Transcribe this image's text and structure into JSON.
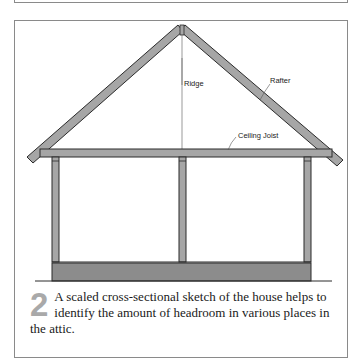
{
  "figure": {
    "step_number": "2",
    "caption": "A scaled cross-sectional sketch of the house helps to identify the amount of headroom in various places in the attic.",
    "labels": {
      "ridge": "Ridge",
      "rafter": "Rafter",
      "ceiling_joist": "Ceiling Joist"
    },
    "colors": {
      "member_fill": "#a6a6a6",
      "member_stroke": "#2b2b2b",
      "foundation_fill": "#8c8c8c",
      "frame_border": "#8a8a8a",
      "number_color": "#a9a9a9"
    }
  }
}
